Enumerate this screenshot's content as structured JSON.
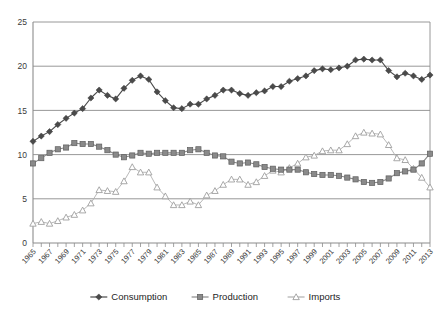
{
  "chart_data": {
    "type": "line",
    "title": "",
    "subtitle": "",
    "xlabel": "",
    "ylabel": "",
    "xlim": [
      1965,
      2013
    ],
    "ylim": [
      0,
      25
    ],
    "yticks": [
      0,
      5,
      10,
      15,
      20,
      25
    ],
    "grid": "horizontal",
    "legend_position": "bottom",
    "x": [
      1965,
      1966,
      1967,
      1968,
      1969,
      1970,
      1971,
      1972,
      1973,
      1974,
      1975,
      1976,
      1977,
      1978,
      1979,
      1980,
      1981,
      1982,
      1983,
      1984,
      1985,
      1986,
      1987,
      1988,
      1989,
      1990,
      1991,
      1992,
      1993,
      1994,
      1995,
      1996,
      1997,
      1998,
      1999,
      2000,
      2001,
      2002,
      2003,
      2004,
      2005,
      2006,
      2007,
      2008,
      2009,
      2010,
      2011,
      2012,
      2013
    ],
    "xtick_labels": [
      "1965",
      "1967",
      "1969",
      "1971",
      "1973",
      "1975",
      "1977",
      "1979",
      "1981",
      "1983",
      "1985",
      "1987",
      "1989",
      "1991",
      "1993",
      "1995",
      "1997",
      "1999",
      "2001",
      "2003",
      "2005",
      "2007",
      "2009",
      "2011",
      "2013"
    ],
    "series": [
      {
        "name": "Consumption",
        "marker": "diamond",
        "color": "#4a4a4a",
        "values": [
          11.5,
          12.1,
          12.6,
          13.4,
          14.1,
          14.7,
          15.2,
          16.4,
          17.3,
          16.7,
          16.3,
          17.5,
          18.4,
          18.9,
          18.5,
          17.1,
          16.1,
          15.3,
          15.2,
          15.7,
          15.7,
          16.3,
          16.7,
          17.3,
          17.3,
          16.9,
          16.7,
          17.0,
          17.2,
          17.7,
          17.7,
          18.3,
          18.6,
          18.9,
          19.5,
          19.7,
          19.6,
          19.8,
          20.0,
          20.7,
          20.8,
          20.7,
          20.7,
          19.5,
          18.8,
          19.2,
          18.9,
          18.5,
          19.0
        ]
      },
      {
        "name": "Production",
        "marker": "square",
        "color": "#8a8a8a",
        "values": [
          9.0,
          9.6,
          10.2,
          10.6,
          10.8,
          11.3,
          11.2,
          11.2,
          10.9,
          10.5,
          10.0,
          9.7,
          9.9,
          10.2,
          10.1,
          10.2,
          10.2,
          10.2,
          10.2,
          10.5,
          10.6,
          10.2,
          9.9,
          9.8,
          9.2,
          9.0,
          9.1,
          8.9,
          8.6,
          8.4,
          8.3,
          8.3,
          8.3,
          8.0,
          7.8,
          7.7,
          7.7,
          7.6,
          7.4,
          7.2,
          6.9,
          6.8,
          6.9,
          7.3,
          7.9,
          8.1,
          8.3,
          9.0,
          10.1
        ]
      },
      {
        "name": "Imports",
        "marker": "triangle",
        "color": "#b0b0b0",
        "values": [
          2.2,
          2.4,
          2.2,
          2.5,
          2.9,
          3.2,
          3.7,
          4.5,
          6.0,
          5.9,
          5.8,
          7.0,
          8.6,
          8.0,
          8.0,
          6.3,
          5.3,
          4.3,
          4.3,
          4.7,
          4.3,
          5.4,
          5.9,
          6.6,
          7.2,
          7.2,
          6.6,
          6.9,
          7.6,
          8.2,
          8.0,
          8.5,
          9.0,
          9.7,
          9.9,
          10.4,
          10.5,
          10.5,
          11.2,
          12.1,
          12.5,
          12.4,
          12.3,
          11.1,
          9.6,
          9.4,
          8.4,
          7.4,
          6.3
        ]
      }
    ]
  },
  "legend": {
    "items": [
      {
        "label": "Consumption"
      },
      {
        "label": "Production"
      },
      {
        "label": "Imports"
      }
    ]
  }
}
